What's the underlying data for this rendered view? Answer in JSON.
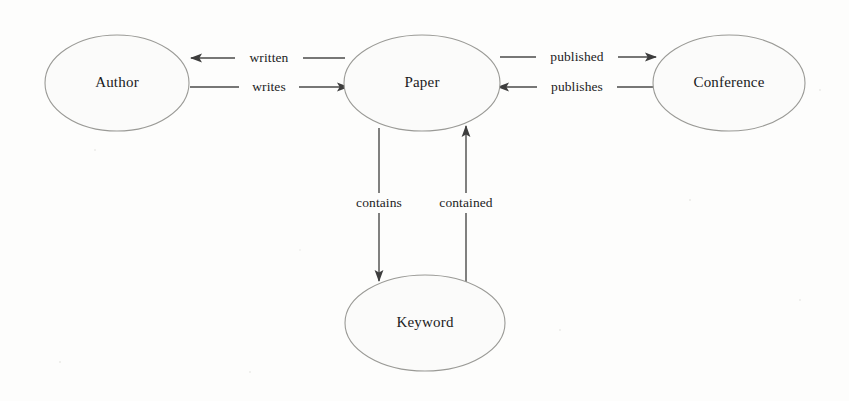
{
  "diagram": {
    "type": "entity-relationship-graph",
    "background_color": "#fdfdfc",
    "node_fill_color": "#fbfbfa",
    "node_stroke_color": "#9a9a96",
    "edge_color": "#4a4a4a",
    "text_color": "#1a1a1a",
    "nodes": [
      {
        "id": "author",
        "label": "Author",
        "cx": 117,
        "cy": 83,
        "rx": 72,
        "ry": 48
      },
      {
        "id": "paper",
        "label": "Paper",
        "cx": 422,
        "cy": 83,
        "rx": 78,
        "ry": 48
      },
      {
        "id": "conference",
        "label": "Conference",
        "cx": 729,
        "cy": 83,
        "rx": 76,
        "ry": 48
      },
      {
        "id": "keyword",
        "label": "Keyword",
        "cx": 425,
        "cy": 323,
        "rx": 80,
        "ry": 48
      }
    ],
    "edges": [
      {
        "id": "written",
        "label": "written",
        "from": "paper",
        "to": "author",
        "direction": "left",
        "label_x": 269,
        "label_y": 58,
        "x1": 345,
        "x2": 191,
        "y": 58
      },
      {
        "id": "writes",
        "label": "writes",
        "from": "author",
        "to": "paper",
        "direction": "right",
        "label_x": 269,
        "label_y": 87,
        "x1": 190,
        "x2": 348,
        "y": 87
      },
      {
        "id": "published",
        "label": "published",
        "from": "paper",
        "to": "conference",
        "direction": "right",
        "label_x": 577,
        "label_y": 57,
        "x1": 500,
        "x2": 656,
        "y": 57
      },
      {
        "id": "publishes",
        "label": "publishes",
        "from": "conference",
        "to": "paper",
        "direction": "left",
        "label_x": 577,
        "label_y": 87,
        "x1": 654,
        "x2": 498,
        "y": 87
      },
      {
        "id": "contains",
        "label": "contains",
        "from": "paper",
        "to": "keyword",
        "direction": "down",
        "label_x": 379,
        "label_y": 203,
        "x": 379,
        "y1": 128,
        "y2": 281
      },
      {
        "id": "contained",
        "label": "contained",
        "from": "keyword",
        "to": "paper",
        "direction": "up",
        "label_x": 466,
        "label_y": 203,
        "x": 466,
        "y1": 322,
        "y2": 126
      }
    ]
  }
}
